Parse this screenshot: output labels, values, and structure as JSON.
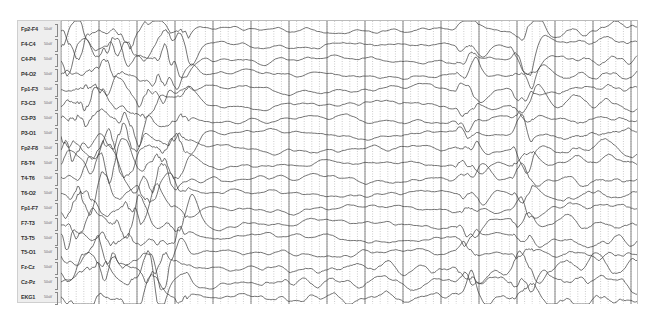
{
  "viewer": {
    "type": "eeg-montage",
    "channel_scale_label": "50uV",
    "channels": [
      {
        "name": "Fp2-F4"
      },
      {
        "name": "F4-C4"
      },
      {
        "name": "C4-P4"
      },
      {
        "name": "P4-O2"
      },
      {
        "name": "Fp1-F3"
      },
      {
        "name": "F3-C3"
      },
      {
        "name": "C3-P3"
      },
      {
        "name": "P3-O1"
      },
      {
        "name": "Fp2-F8"
      },
      {
        "name": "F8-T4"
      },
      {
        "name": "T4-T6"
      },
      {
        "name": "T6-O2"
      },
      {
        "name": "Fp1-F7"
      },
      {
        "name": "F7-T3"
      },
      {
        "name": "T3-T5"
      },
      {
        "name": "T5-O1"
      },
      {
        "name": "Fz-Cz"
      },
      {
        "name": "Cz-Pz"
      },
      {
        "name": "EKG1"
      }
    ],
    "colors": {
      "trace": "#3a3a3a",
      "grid_major": "#555555",
      "grid_minor": "#9a9a9a",
      "label_bg": "#eeeeee"
    }
  }
}
